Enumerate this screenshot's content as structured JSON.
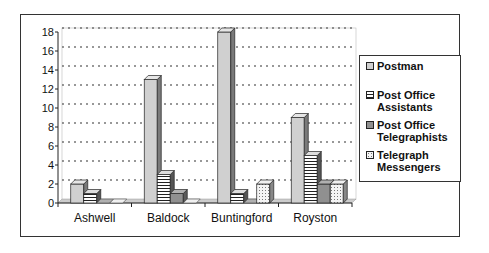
{
  "chart_data": {
    "type": "bar",
    "title": "",
    "xlabel": "",
    "ylabel": "",
    "categories": [
      "Ashwell",
      "Baldock",
      "Buntingford",
      "Royston"
    ],
    "series": [
      {
        "name": "Postman",
        "values": [
          2,
          13,
          18,
          9
        ],
        "color": "#d0d0d0",
        "pattern": "solid-light"
      },
      {
        "name": "Post Office Assistants",
        "values": [
          1,
          3,
          1,
          5
        ],
        "color": "#ffffff",
        "pattern": "horizontal-stripes"
      },
      {
        "name": "Post Office Telegraphists",
        "values": [
          0,
          1,
          0,
          2
        ],
        "color": "#909090",
        "pattern": "solid-mid"
      },
      {
        "name": "Telegraph Messengers",
        "values": [
          0,
          0,
          2,
          2
        ],
        "color": "#eeeeee",
        "pattern": "dotted"
      }
    ],
    "yticks": [
      0,
      2,
      4,
      6,
      8,
      10,
      12,
      14,
      16,
      18
    ],
    "ylim": [
      0,
      18
    ],
    "grid": true,
    "legend_position": "right",
    "style": "3d-clustered-column"
  },
  "legend": {
    "items": [
      {
        "label_line1": "Postman",
        "label_line2": ""
      },
      {
        "label_line1": "Post Office",
        "label_line2": "Assistants"
      },
      {
        "label_line1": "Post Office",
        "label_line2": "Telegraphists"
      },
      {
        "label_line1": "Telegraph",
        "label_line2": "Messengers"
      }
    ]
  }
}
